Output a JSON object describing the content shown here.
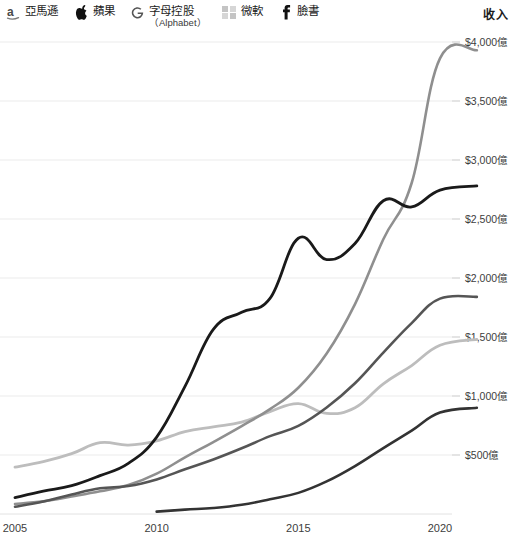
{
  "legend": {
    "items": [
      {
        "icon": "amazon-logo-icon",
        "label": "亞馬遜",
        "sublabel": "",
        "color": "#8f8f8f"
      },
      {
        "icon": "apple-logo-icon",
        "label": "蘋果",
        "sublabel": "",
        "color": "#1a1a1a"
      },
      {
        "icon": "google-g-logo-icon",
        "label": "字母控股",
        "sublabel": "（Alphabet）",
        "color": "#555555"
      },
      {
        "icon": "microsoft-logo-icon",
        "label": "微軟",
        "sublabel": "",
        "color": "#bdbdbd"
      },
      {
        "icon": "facebook-logo-icon",
        "label": "臉書",
        "sublabel": "",
        "color": "#333333"
      }
    ]
  },
  "axis_title": "收入",
  "chart_data": {
    "type": "line",
    "title": "收入",
    "xlabel": "",
    "ylabel": "收入",
    "xlim": [
      2005,
      2021.5
    ],
    "ylim": [
      0,
      4000
    ],
    "grid": true,
    "legend_position": "top-left",
    "x_ticks": [
      2005,
      2010,
      2015,
      2020
    ],
    "x_tick_labels": [
      "2005",
      "2010",
      "2015",
      "2020"
    ],
    "y_ticks": [
      500,
      1000,
      1500,
      2000,
      2500,
      3000,
      3500,
      4000
    ],
    "y_tick_labels": [
      "$500億",
      "$1,000億",
      "$1,500億",
      "$2,000億",
      "$2,500億",
      "$3,000億",
      "$3,500億",
      "$4,000億"
    ],
    "series": [
      {
        "name": "亞馬遜",
        "color": "#8f8f8f",
        "width": 2.6,
        "x": [
          2005,
          2006,
          2007,
          2008,
          2009,
          2010,
          2011,
          2012,
          2013,
          2014,
          2015,
          2016,
          2017,
          2018,
          2019,
          2020,
          2021.3
        ],
        "values": [
          85,
          107,
          148,
          192,
          245,
          342,
          480,
          610,
          745,
          889,
          1070,
          1360,
          1779,
          2329,
          2805,
          3861,
          3930
        ]
      },
      {
        "name": "蘋果",
        "color": "#1a1a1a",
        "width": 2.8,
        "x": [
          2005,
          2006,
          2007,
          2008,
          2009,
          2010,
          2011,
          2012,
          2013,
          2014,
          2015,
          2016,
          2017,
          2018,
          2019,
          2020,
          2021.3
        ],
        "values": [
          139,
          193,
          240,
          325,
          429,
          652,
          1082,
          1565,
          1709,
          1827,
          2337,
          2156,
          2292,
          2655,
          2602,
          2745,
          2780
        ]
      },
      {
        "name": "字母控股（Alphabet）",
        "color": "#555555",
        "width": 2.6,
        "x": [
          2005,
          2006,
          2007,
          2008,
          2009,
          2010,
          2011,
          2012,
          2013,
          2014,
          2015,
          2016,
          2017,
          2018,
          2019,
          2020,
          2021.3
        ],
        "values": [
          61,
          106,
          166,
          218,
          237,
          293,
          379,
          462,
          557,
          660,
          747,
          903,
          1108,
          1368,
          1618,
          1825,
          1840
        ]
      },
      {
        "name": "微軟",
        "color": "#bdbdbd",
        "width": 2.8,
        "x": [
          2005,
          2006,
          2007,
          2008,
          2009,
          2010,
          2011,
          2012,
          2013,
          2014,
          2015,
          2016,
          2017,
          2018,
          2019,
          2020,
          2021.3
        ],
        "values": [
          397,
          443,
          511,
          604,
          584,
          620,
          699,
          739,
          778,
          868,
          936,
          853,
          900,
          1103,
          1258,
          1430,
          1480
        ]
      },
      {
        "name": "臉書",
        "color": "#333333",
        "width": 2.6,
        "x": [
          2010,
          2011,
          2012,
          2013,
          2014,
          2015,
          2016,
          2017,
          2018,
          2019,
          2020,
          2021.3
        ],
        "values": [
          20,
          37,
          51,
          78,
          125,
          179,
          276,
          406,
          559,
          707,
          860,
          900
        ]
      }
    ]
  }
}
